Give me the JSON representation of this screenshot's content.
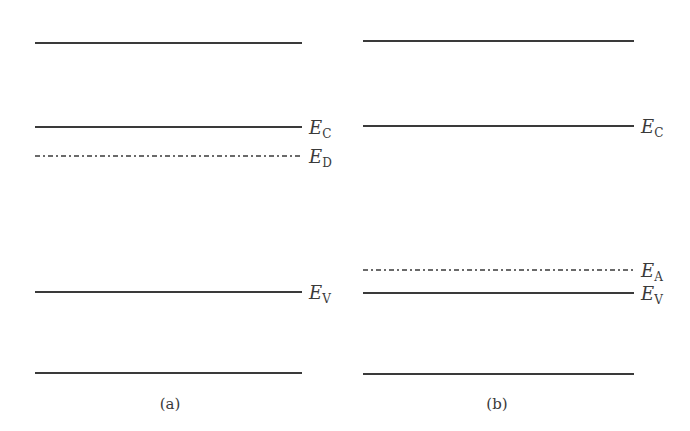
{
  "colors": {
    "line": "#3a3a3a",
    "background": "#ffffff"
  },
  "panels": [
    {
      "id": "a",
      "caption": "(a)",
      "x1": 35,
      "x2": 302,
      "caption_x": 170,
      "caption_y": 409,
      "levels": [
        {
          "name": "top-band-edge",
          "y": 43,
          "style": "solid",
          "label": null
        },
        {
          "name": "conduction-band",
          "y": 127,
          "style": "solid",
          "label": {
            "main": "E",
            "sub": "C"
          }
        },
        {
          "name": "donor-level",
          "y": 156,
          "style": "dashdot",
          "label": {
            "main": "E",
            "sub": "D"
          }
        },
        {
          "name": "valence-band",
          "y": 292,
          "style": "solid",
          "label": {
            "main": "E",
            "sub": "V"
          }
        },
        {
          "name": "bottom-band-edge",
          "y": 373,
          "style": "solid",
          "label": null
        }
      ]
    },
    {
      "id": "b",
      "caption": "(b)",
      "x1": 363,
      "x2": 634,
      "caption_x": 497,
      "caption_y": 409,
      "levels": [
        {
          "name": "top-band-edge",
          "y": 41,
          "style": "solid",
          "label": null
        },
        {
          "name": "conduction-band",
          "y": 126,
          "style": "solid",
          "label": {
            "main": "E",
            "sub": "C"
          }
        },
        {
          "name": "acceptor-level",
          "y": 270,
          "style": "dashdot",
          "label": {
            "main": "E",
            "sub": "A"
          }
        },
        {
          "name": "valence-band",
          "y": 293,
          "style": "solid",
          "label": {
            "main": "E",
            "sub": "V"
          }
        },
        {
          "name": "bottom-band-edge",
          "y": 374,
          "style": "solid",
          "label": null
        }
      ]
    }
  ]
}
